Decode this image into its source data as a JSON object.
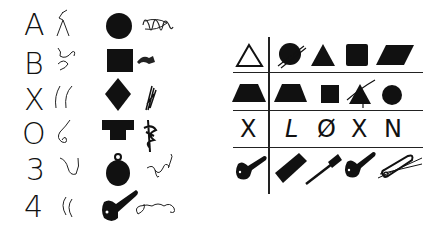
{
  "left_panel": {
    "symbols": [
      "A",
      "B",
      "X",
      "O",
      "3",
      "4"
    ],
    "shapes": [
      "circle",
      "square",
      "diamond",
      "t-shape",
      "round-pendant",
      "key"
    ]
  },
  "right_panel": {
    "rows": [
      {
        "key": "triangle-outline",
        "items": [
          "crossed-circle",
          "triangle",
          "square",
          "parallelogram"
        ]
      },
      {
        "key": "trapezoid",
        "items": [
          "trapezoid",
          "square",
          "crossed-triangle",
          "circle"
        ]
      },
      {
        "key": "X",
        "items": [
          "L",
          "Ø",
          "X",
          "N"
        ]
      },
      {
        "key": "key",
        "items": [
          "comb",
          "fine-comb",
          "key",
          "crossed-safety-pin"
        ]
      }
    ]
  }
}
